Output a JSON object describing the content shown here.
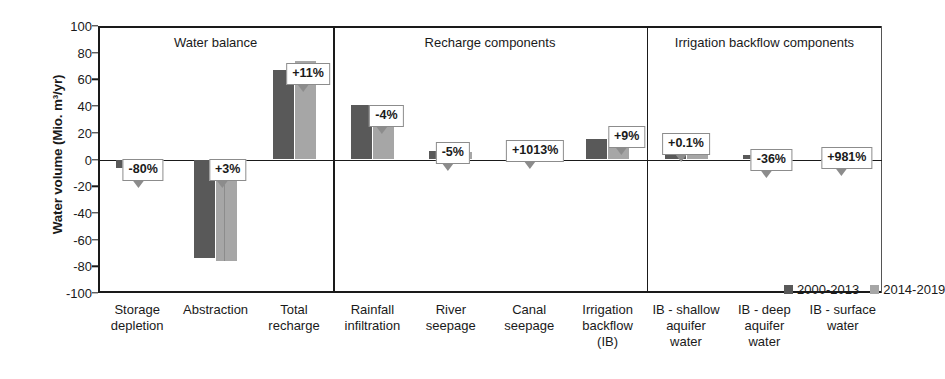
{
  "chart_data": {
    "type": "bar",
    "title": "",
    "xlabel": "",
    "ylabel": "Water volume (Mio. m³/yr)",
    "ylim": [
      -100,
      100
    ],
    "yticks": [
      100,
      80,
      60,
      40,
      20,
      0,
      -20,
      -40,
      -60,
      -80,
      -100
    ],
    "ytick_labels": [
      "100",
      "80",
      "60",
      "40",
      "20",
      "0",
      "-20",
      "-40",
      "-60",
      "-80",
      "-100"
    ],
    "grid": false,
    "legend_position": "inside-bottom-right",
    "categories": [
      "Storage depletion",
      "Abstraction",
      "Total recharge",
      "Rainfall infiltration",
      "River seepage",
      "Canal seepage",
      "Irrigation backflow (IB)",
      "IB - shallow aquifer water",
      "IB - deep aquifer water",
      "IB - surface water"
    ],
    "category_lines": [
      [
        "Storage",
        "depletion"
      ],
      [
        "Abstraction"
      ],
      [
        "Total",
        "recharge"
      ],
      [
        "Rainfall",
        "infiltration"
      ],
      [
        "River",
        "seepage"
      ],
      [
        "Canal",
        "seepage"
      ],
      [
        "Irrigation",
        "backflow",
        "(IB)"
      ],
      [
        "IB - shallow",
        "aquifer",
        "water"
      ],
      [
        "IB - deep",
        "aquifer",
        "water"
      ],
      [
        "IB - surface",
        "water"
      ]
    ],
    "series": [
      {
        "name": "2000-2013",
        "color": "#595959",
        "values": [
          -6.5,
          -74,
          67,
          41,
          6,
          0.6,
          15,
          11,
          3,
          0.2
        ]
      },
      {
        "name": "2014-2019",
        "color": "#a6a6a6",
        "values": [
          -1.3,
          -76,
          74,
          39,
          5.7,
          6.7,
          16.4,
          11,
          1.9,
          2.5
        ]
      }
    ],
    "annotations": [
      "-80%",
      "+3%",
      "+11%",
      "-4%",
      "-5%",
      "+1013%",
      "+9%",
      "+0.1%",
      "-36%",
      "+981%"
    ],
    "panels": [
      {
        "title": "Water balance",
        "start": 0,
        "end": 2
      },
      {
        "title": "Recharge components",
        "start": 3,
        "end": 6
      },
      {
        "title": "Irrigation backflow components",
        "start": 7,
        "end": 9
      }
    ]
  },
  "legend": {
    "entries": [
      {
        "label": "2000-2013",
        "color": "#595959"
      },
      {
        "label": "2014-2019",
        "color": "#a6a6a6"
      }
    ]
  }
}
